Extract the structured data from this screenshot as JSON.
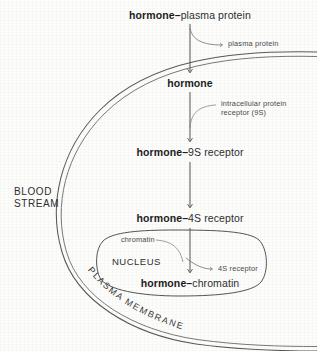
{
  "figure": {
    "type": "biology-flow-diagram",
    "background_color": "#fdfdfc",
    "ink_color": "#3a3a3a"
  },
  "regions": {
    "blood_stream_line1": "BLOOD",
    "blood_stream_line2": "STREAM",
    "nucleus": "NUCLEUS",
    "plasma_membrane": "PLASMA MEMBRANE"
  },
  "cascade": [
    {
      "id": "hormone-plasma-protein",
      "bold_part": "hormone",
      "dash": "–",
      "plain_part": "plasma protein"
    },
    {
      "id": "hormone",
      "bold_part": "hormone",
      "dash": "",
      "plain_part": ""
    },
    {
      "id": "hormone-9s-receptor",
      "bold_part": "hormone",
      "dash": "–",
      "plain_part": "9S receptor"
    },
    {
      "id": "hormone-4s-receptor",
      "bold_part": "hormone",
      "dash": "–",
      "plain_part": "4S receptor"
    },
    {
      "id": "hormone-chromatin",
      "bold_part": "hormone",
      "dash": "–",
      "plain_part": "chromatin"
    }
  ],
  "annotations": {
    "plasma_protein": "plasma protein",
    "intracellular_receptor_line1": "intracellular protein",
    "intracellular_receptor_line2": "receptor (9S)",
    "chromatin": "chromatin",
    "receptor_4s": "4S receptor"
  }
}
